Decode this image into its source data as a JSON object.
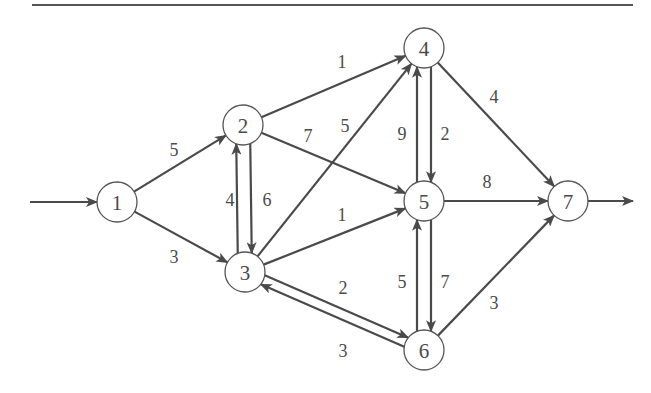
{
  "diagram": {
    "type": "directed-weighted-network",
    "colors": {
      "edge": "#4a4a4a",
      "node_stroke": "#555555",
      "text": "#4a4a4a",
      "background": "#ffffff"
    },
    "top_rule": {
      "x1": 32,
      "x2": 633,
      "y": 5
    },
    "nodes": [
      {
        "id": "1",
        "label": "1",
        "x": 117,
        "y": 202
      },
      {
        "id": "2",
        "label": "2",
        "x": 243,
        "y": 125
      },
      {
        "id": "3",
        "label": "3",
        "x": 245,
        "y": 272
      },
      {
        "id": "4",
        "label": "4",
        "x": 424,
        "y": 48
      },
      {
        "id": "5",
        "label": "5",
        "x": 424,
        "y": 201
      },
      {
        "id": "6",
        "label": "6",
        "x": 424,
        "y": 350
      },
      {
        "id": "7",
        "label": "7",
        "x": 568,
        "y": 201
      }
    ],
    "node_radius": 20,
    "source_arrow": {
      "from_x": 30,
      "to": "1"
    },
    "sink_arrow": {
      "from": "7",
      "to_x": 633
    },
    "edges": [
      {
        "from": "1",
        "to": "2",
        "weight": "5",
        "label_x": 174,
        "label_y": 150
      },
      {
        "from": "1",
        "to": "3",
        "weight": "3",
        "label_x": 174,
        "label_y": 257
      },
      {
        "from": "2",
        "to": "3",
        "weight": "4",
        "label_x": 230,
        "label_y": 200,
        "offset": -7
      },
      {
        "from": "3",
        "to": "2",
        "weight": "6",
        "label_x": 267,
        "label_y": 200,
        "offset": 7
      },
      {
        "from": "2",
        "to": "4",
        "weight": "1",
        "label_x": 342,
        "label_y": 62
      },
      {
        "from": "2",
        "to": "5",
        "weight": "7",
        "label_x": 308,
        "label_y": 136
      },
      {
        "from": "3",
        "to": "4",
        "weight": "5",
        "label_x": 345,
        "label_y": 126
      },
      {
        "from": "3",
        "to": "5",
        "weight": "1",
        "label_x": 342,
        "label_y": 215
      },
      {
        "from": "3",
        "to": "6",
        "weight": "2",
        "label_x": 343,
        "label_y": 288,
        "offset": -5
      },
      {
        "from": "6",
        "to": "3",
        "weight": "3",
        "label_x": 343,
        "label_y": 351,
        "offset": 5
      },
      {
        "from": "4",
        "to": "5",
        "weight": "9",
        "label_x": 402,
        "label_y": 134,
        "offset": -7
      },
      {
        "from": "5",
        "to": "4",
        "weight": "2",
        "label_x": 445,
        "label_y": 134,
        "offset": 7
      },
      {
        "from": "5",
        "to": "6",
        "weight": "5",
        "label_x": 402,
        "label_y": 282,
        "offset": -7
      },
      {
        "from": "6",
        "to": "5",
        "weight": "7",
        "label_x": 445,
        "label_y": 282,
        "offset": 7
      },
      {
        "from": "4",
        "to": "7",
        "weight": "4",
        "label_x": 494,
        "label_y": 97
      },
      {
        "from": "5",
        "to": "7",
        "weight": "8",
        "label_x": 487,
        "label_y": 182
      },
      {
        "from": "6",
        "to": "7",
        "weight": "3",
        "label_x": 494,
        "label_y": 303
      }
    ]
  }
}
